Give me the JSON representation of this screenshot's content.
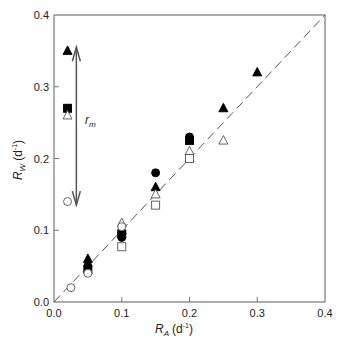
{
  "chart_data": {
    "type": "scatter",
    "title": "",
    "xlabel": "R_A (d^-1)",
    "ylabel": "R_W (d^-1)",
    "xlabel_main": "R",
    "xlabel_sub": "A",
    "xlabel_unit": "(d",
    "xlabel_exp": "-1",
    "xlabel_close": ")",
    "ylabel_main": "R",
    "ylabel_sub": "W",
    "ylabel_unit": "(d",
    "ylabel_exp": "-1",
    "ylabel_close": ")",
    "xlim": [
      0,
      0.4
    ],
    "ylim": [
      0,
      0.4
    ],
    "xticks": [
      "0.0",
      "0.1",
      "0.2",
      "0.3",
      "0.4"
    ],
    "yticks": [
      "0.0",
      "0.1",
      "0.2",
      "0.3",
      "0.4"
    ],
    "grid": false,
    "legend": "none",
    "reference_line": {
      "style": "dashed",
      "from": [
        0,
        0
      ],
      "to": [
        0.4,
        0.4
      ],
      "label": "1:1 line"
    },
    "annotation": {
      "text": "r",
      "subscript": "m",
      "type": "double-arrow",
      "x": 0.033,
      "y_from": 0.135,
      "y_to": 0.355
    },
    "series": [
      {
        "name": "filled-triangle",
        "marker": "triangle",
        "filled": true,
        "points": [
          [
            0.02,
            0.35
          ],
          [
            0.05,
            0.06
          ],
          [
            0.1,
            0.1
          ],
          [
            0.15,
            0.16
          ],
          [
            0.2,
            0.2
          ],
          [
            0.25,
            0.27
          ],
          [
            0.3,
            0.32
          ]
        ]
      },
      {
        "name": "filled-circle",
        "marker": "circle",
        "filled": true,
        "points": [
          [
            0.02,
            0.27
          ],
          [
            0.05,
            0.05
          ],
          [
            0.1,
            0.09
          ],
          [
            0.15,
            0.18
          ],
          [
            0.2,
            0.23
          ]
        ]
      },
      {
        "name": "filled-square",
        "marker": "square",
        "filled": true,
        "points": [
          [
            0.02,
            0.27
          ],
          [
            0.05,
            0.045
          ],
          [
            0.1,
            0.095
          ],
          [
            0.2,
            0.225
          ]
        ]
      },
      {
        "name": "open-triangle",
        "marker": "triangle",
        "filled": false,
        "points": [
          [
            0.02,
            0.26
          ],
          [
            0.1,
            0.11
          ],
          [
            0.15,
            0.15
          ],
          [
            0.2,
            0.21
          ],
          [
            0.25,
            0.225
          ]
        ]
      },
      {
        "name": "open-circle",
        "marker": "circle",
        "filled": false,
        "points": [
          [
            0.02,
            0.14
          ],
          [
            0.025,
            0.02
          ],
          [
            0.05,
            0.04
          ],
          [
            0.1,
            0.105
          ]
        ]
      },
      {
        "name": "open-square",
        "marker": "square",
        "filled": false,
        "points": [
          [
            0.1,
            0.077
          ],
          [
            0.15,
            0.135
          ],
          [
            0.2,
            0.2
          ]
        ]
      }
    ]
  }
}
